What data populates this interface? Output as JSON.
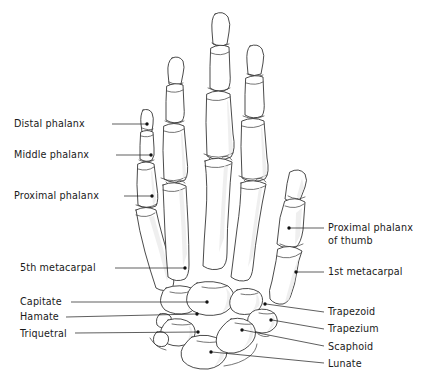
{
  "figure": {
    "view": "dorsal view of right hand skeleton",
    "background_color": "#ffffff",
    "line_color": "#2b2b2b",
    "text_color": "#1a1a1a"
  },
  "labels": [
    {
      "id": "distal-phalanx",
      "text": "Distal phalanx",
      "side": "left",
      "text_x": 14,
      "text_y": 127,
      "leader": "M 112 124 L 146 124",
      "dot_x": 147,
      "dot_y": 124
    },
    {
      "id": "middle-phalanx",
      "text": "Middle phalanx",
      "side": "left",
      "text_x": 14,
      "text_y": 158,
      "leader": "M 116 155 L 150 155",
      "dot_x": 151,
      "dot_y": 155
    },
    {
      "id": "proximal-phalanx",
      "text": "Proximal phalanx",
      "side": "left",
      "text_x": 14,
      "text_y": 199,
      "leader": "M 124 196 L 151 196",
      "dot_x": 152,
      "dot_y": 196
    },
    {
      "id": "fifth-metacarpal",
      "text": "5th metacarpal",
      "side": "left",
      "text_x": 20,
      "text_y": 271,
      "leader": "M 115 268 L 184 268",
      "dot_x": 185,
      "dot_y": 268
    },
    {
      "id": "capitate",
      "text": "Capitate",
      "side": "left",
      "text_x": 20,
      "text_y": 305,
      "leader": "M 71 302 L 206 302",
      "dot_x": 207,
      "dot_y": 302
    },
    {
      "id": "hamate",
      "text": "Hamate",
      "side": "left",
      "text_x": 20,
      "text_y": 320,
      "leader": "M 66 317 L 196 314",
      "dot_x": 197,
      "dot_y": 314
    },
    {
      "id": "triquetral",
      "text": "Triquetral",
      "side": "left",
      "text_x": 20,
      "text_y": 337,
      "leader": "M 75 333 L 197 332",
      "dot_x": 198,
      "dot_y": 332
    },
    {
      "id": "proximal-phalanx-of-thumb",
      "text": "Proximal phalanx",
      "text_line2": "of thumb",
      "side": "right",
      "text_x": 328,
      "text_y": 231,
      "text2_x": 328,
      "text2_y": 244,
      "leader": "M 290 228 L 324 228",
      "dot_x": 289,
      "dot_y": 228
    },
    {
      "id": "first-metacarpal",
      "text": "1st metacarpal",
      "side": "right",
      "text_x": 328,
      "text_y": 275,
      "leader": "M 297 272 L 324 272",
      "dot_x": 296,
      "dot_y": 272
    },
    {
      "id": "trapezoid",
      "text": "Trapezoid",
      "side": "right",
      "text_x": 328,
      "text_y": 315,
      "leader": "M 266 304 L 324 312",
      "dot_x": 265,
      "dot_y": 304
    },
    {
      "id": "trapezium",
      "text": "Trapezium",
      "side": "right",
      "text_x": 328,
      "text_y": 332,
      "leader": "M 272 320 L 324 329",
      "dot_x": 271,
      "dot_y": 320
    },
    {
      "id": "scaphoid",
      "text": "Scaphoid",
      "side": "right",
      "text_x": 328,
      "text_y": 350,
      "leader": "M 243 330 L 324 346",
      "dot_x": 242,
      "dot_y": 330
    },
    {
      "id": "lunate",
      "text": "Lunate",
      "side": "right",
      "text_x": 328,
      "text_y": 367,
      "leader": "M 212 352 L 324 363",
      "dot_x": 211,
      "dot_y": 352
    }
  ],
  "bone_groups": [
    {
      "id": "distal-phalanges",
      "name": "Distal phalanges",
      "count": 5
    },
    {
      "id": "middle-phalanges",
      "name": "Middle phalanges",
      "count": 4
    },
    {
      "id": "proximal-phalanges",
      "name": "Proximal phalanges",
      "count": 5
    },
    {
      "id": "metacarpals",
      "name": "Metacarpals",
      "count": 5
    },
    {
      "id": "carpals",
      "name": "Carpal bones",
      "count": 8
    }
  ]
}
